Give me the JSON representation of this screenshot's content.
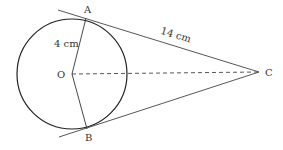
{
  "diagram": {
    "type": "circle-tangents",
    "points": {
      "A": {
        "label": "A"
      },
      "B": {
        "label": "B"
      },
      "O": {
        "label": "O"
      },
      "C": {
        "label": "C"
      }
    },
    "measurements": {
      "radius": "4 cm",
      "tangent_length": "14 cm"
    }
  }
}
